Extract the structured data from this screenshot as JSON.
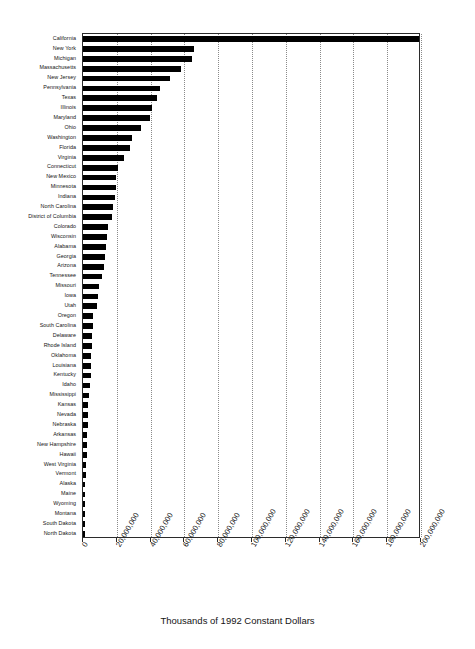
{
  "chart_data": {
    "type": "bar",
    "orientation": "horizontal",
    "title": "",
    "subtitle": "",
    "xlabel": "Thousands of 1992 Constant Dollars",
    "ylabel": "",
    "xlim": [
      0,
      200000000
    ],
    "xticks": [
      0,
      20000000,
      40000000,
      60000000,
      80000000,
      100000000,
      120000000,
      140000000,
      160000000,
      180000000,
      200000000
    ],
    "xtick_labels": [
      "0",
      "20,000,000",
      "40,000,000",
      "60,000,000",
      "80,000,000",
      "100,000,000",
      "120,000,000",
      "140,000,000",
      "160,000,000",
      "180,000,000",
      "200,000,000"
    ],
    "grid": true,
    "grid_axis": "x",
    "legend": false,
    "legend_position": "none",
    "bar_color": "#000000",
    "background_color": "#ffffff",
    "categories": [
      "California",
      "New York",
      "Michigan",
      "Massachusetts",
      "New Jersey",
      "Pennsylvania",
      "Texas",
      "Illinois",
      "Maryland",
      "Ohio",
      "Washington",
      "Florida",
      "Virginia",
      "Connecticut",
      "New Mexico",
      "Minnesota",
      "Indiana",
      "North Carolina",
      "District of Columbia",
      "Colorado",
      "Wisconsin",
      "Alabama",
      "Georgia",
      "Arizona",
      "Tennessee",
      "Missouri",
      "Iowa",
      "Utah",
      "Oregon",
      "South Carolina",
      "Delaware",
      "Rhode Island",
      "Oklahoma",
      "Louisiana",
      "Kentucky",
      "Idaho",
      "Mississippi",
      "Kansas",
      "Nevada",
      "Nebraska",
      "Arkansas",
      "New Hampshire",
      "Hawaii",
      "West Virginia",
      "Vermont",
      "Alaska",
      "Maine",
      "Wyoming",
      "Montana",
      "South Dakota",
      "North Dakota"
    ],
    "values": [
      199000000,
      65700000,
      64500000,
      58000000,
      51500000,
      45500000,
      43500000,
      41000000,
      39500000,
      34500000,
      29000000,
      28000000,
      24500000,
      20500000,
      19800000,
      19500000,
      19000000,
      17500000,
      17000000,
      14500000,
      14000000,
      13500000,
      13000000,
      12500000,
      11000000,
      9200000,
      8600000,
      8200000,
      6200000,
      5900000,
      5600000,
      5300000,
      5000000,
      4800000,
      4600000,
      4400000,
      3400000,
      3100000,
      2900000,
      2700000,
      2500000,
      2300000,
      2100000,
      1900000,
      1600000,
      1400000,
      1200000,
      900000,
      700000,
      500000,
      300000
    ]
  },
  "axis": {
    "x_title": "Thousands of 1992 Constant Dollars"
  }
}
